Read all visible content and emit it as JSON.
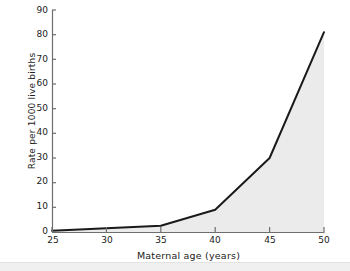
{
  "chart_data": {
    "type": "area",
    "title": "",
    "xlabel": "Maternal age (years)",
    "ylabel": "Rate per 1000 live births",
    "x": [
      25,
      30,
      35,
      40,
      45,
      50
    ],
    "values": [
      0.5,
      1.5,
      2.5,
      9,
      30,
      81
    ],
    "series": [
      {
        "name": "Rate per 1000 live births",
        "values": [
          0.5,
          1.5,
          2.5,
          9,
          30,
          81
        ]
      }
    ],
    "xlim": [
      25,
      50
    ],
    "ylim": [
      0,
      90
    ],
    "xticks": [
      "25",
      "30",
      "35",
      "40",
      "45",
      "50"
    ],
    "yticks": [
      "0",
      "10",
      "20",
      "30",
      "40",
      "50",
      "60",
      "70",
      "80",
      "90"
    ],
    "grid": false,
    "legend": false,
    "legend_position": "none",
    "line_color": "#1a1a1a",
    "fill_color": "#ebebeb",
    "axis_color": "#6e6e6e",
    "background_color": "#ffffff"
  }
}
